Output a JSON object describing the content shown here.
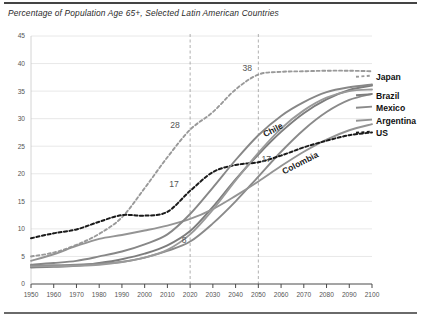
{
  "chart_data": {
    "type": "line",
    "title": "Percentage of Population Age 65+, Selected Latin American Countries",
    "xlabel": "",
    "ylabel": "",
    "xlim": [
      1950,
      2100
    ],
    "ylim": [
      0,
      45
    ],
    "x_ticks": [
      1950,
      1960,
      1970,
      1980,
      1990,
      2000,
      2010,
      2020,
      2030,
      2040,
      2050,
      2060,
      2070,
      2080,
      2090,
      2100
    ],
    "y_ticks": [
      0,
      5,
      10,
      15,
      20,
      25,
      30,
      35,
      40,
      45
    ],
    "grid": "horizontal",
    "legend_position": "right",
    "reference_lines": [
      2020,
      2050
    ],
    "x": [
      1950,
      1960,
      1970,
      1980,
      1990,
      2000,
      2010,
      2020,
      2030,
      2040,
      2050,
      2060,
      2070,
      2080,
      2090,
      2100
    ],
    "series": [
      {
        "name": "Japan",
        "style": "dashed",
        "color": "#999999",
        "values": [
          5.0,
          5.7,
          7.1,
          9.1,
          12.1,
          17.4,
          23.0,
          28.0,
          31.2,
          35.3,
          38.0,
          38.5,
          38.6,
          38.7,
          38.7,
          38.6
        ]
      },
      {
        "name": "Brazil",
        "style": "solid",
        "color": "#7d7d7d",
        "values": [
          3.0,
          3.1,
          3.3,
          3.8,
          4.5,
          5.5,
          7.0,
          9.6,
          14.0,
          19.0,
          23.5,
          27.6,
          31.0,
          33.5,
          35.2,
          36.0
        ]
      },
      {
        "name": "Mexico",
        "style": "solid",
        "color": "#8a8a8a",
        "values": [
          3.3,
          3.4,
          3.5,
          3.7,
          4.0,
          4.8,
          6.0,
          7.7,
          11.0,
          15.0,
          19.5,
          24.0,
          28.0,
          31.2,
          33.4,
          34.5
        ]
      },
      {
        "name": "Argentina",
        "style": "solid",
        "color": "#949494",
        "values": [
          4.2,
          5.4,
          6.9,
          8.2,
          8.9,
          9.7,
          10.6,
          11.8,
          13.6,
          16.0,
          18.6,
          21.4,
          24.0,
          26.2,
          27.9,
          29.0
        ]
      },
      {
        "name": "US",
        "style": "dashed",
        "color": "#1a1a1a",
        "values": [
          8.3,
          9.2,
          9.9,
          11.3,
          12.5,
          12.4,
          13.1,
          16.9,
          20.3,
          21.6,
          22.1,
          23.3,
          24.8,
          26.0,
          27.0,
          27.5
        ]
      },
      {
        "name": "Chile",
        "style": "solid",
        "color": "#878787",
        "values": [
          3.5,
          3.8,
          4.2,
          5.0,
          5.9,
          7.2,
          9.0,
          12.7,
          17.5,
          22.5,
          27.0,
          30.5,
          33.0,
          34.8,
          35.7,
          36.2
        ]
      },
      {
        "name": "Colombia",
        "style": "solid",
        "color": "#9a9a9a",
        "values": [
          3.2,
          3.2,
          3.3,
          3.5,
          4.0,
          4.8,
          6.2,
          9.0,
          13.5,
          18.8,
          23.8,
          28.2,
          31.5,
          33.8,
          35.0,
          35.3
        ]
      }
    ],
    "point_annotations": [
      {
        "text": "38",
        "x": 2050,
        "y": 38.0,
        "series": "Japan"
      },
      {
        "text": "28",
        "x": 2020,
        "y": 28.0,
        "series": "Japan"
      },
      {
        "text": "17",
        "x": 2020,
        "y": 16.9,
        "series": "US"
      },
      {
        "text": "17",
        "x": 2050,
        "y": 22.1,
        "series": "US"
      },
      {
        "text": "8",
        "x": 2020,
        "y": 9.6,
        "series": "Brazil"
      }
    ],
    "inline_series_labels": [
      {
        "text": "Chile",
        "x": 2057,
        "y": 27.5
      },
      {
        "text": "Colombia",
        "x": 2069,
        "y": 21.5
      }
    ],
    "legend_entries": [
      {
        "label": "Japan",
        "style": "dashed",
        "color": "#999999"
      },
      {
        "label": "Brazil",
        "style": "solid",
        "color": "#7d7d7d"
      },
      {
        "label": "Mexico",
        "style": "solid",
        "color": "#8a8a8a"
      },
      {
        "label": "Argentina",
        "style": "solid",
        "color": "#949494"
      },
      {
        "label": "US",
        "style": "dashed",
        "color": "#1a1a1a"
      }
    ]
  }
}
